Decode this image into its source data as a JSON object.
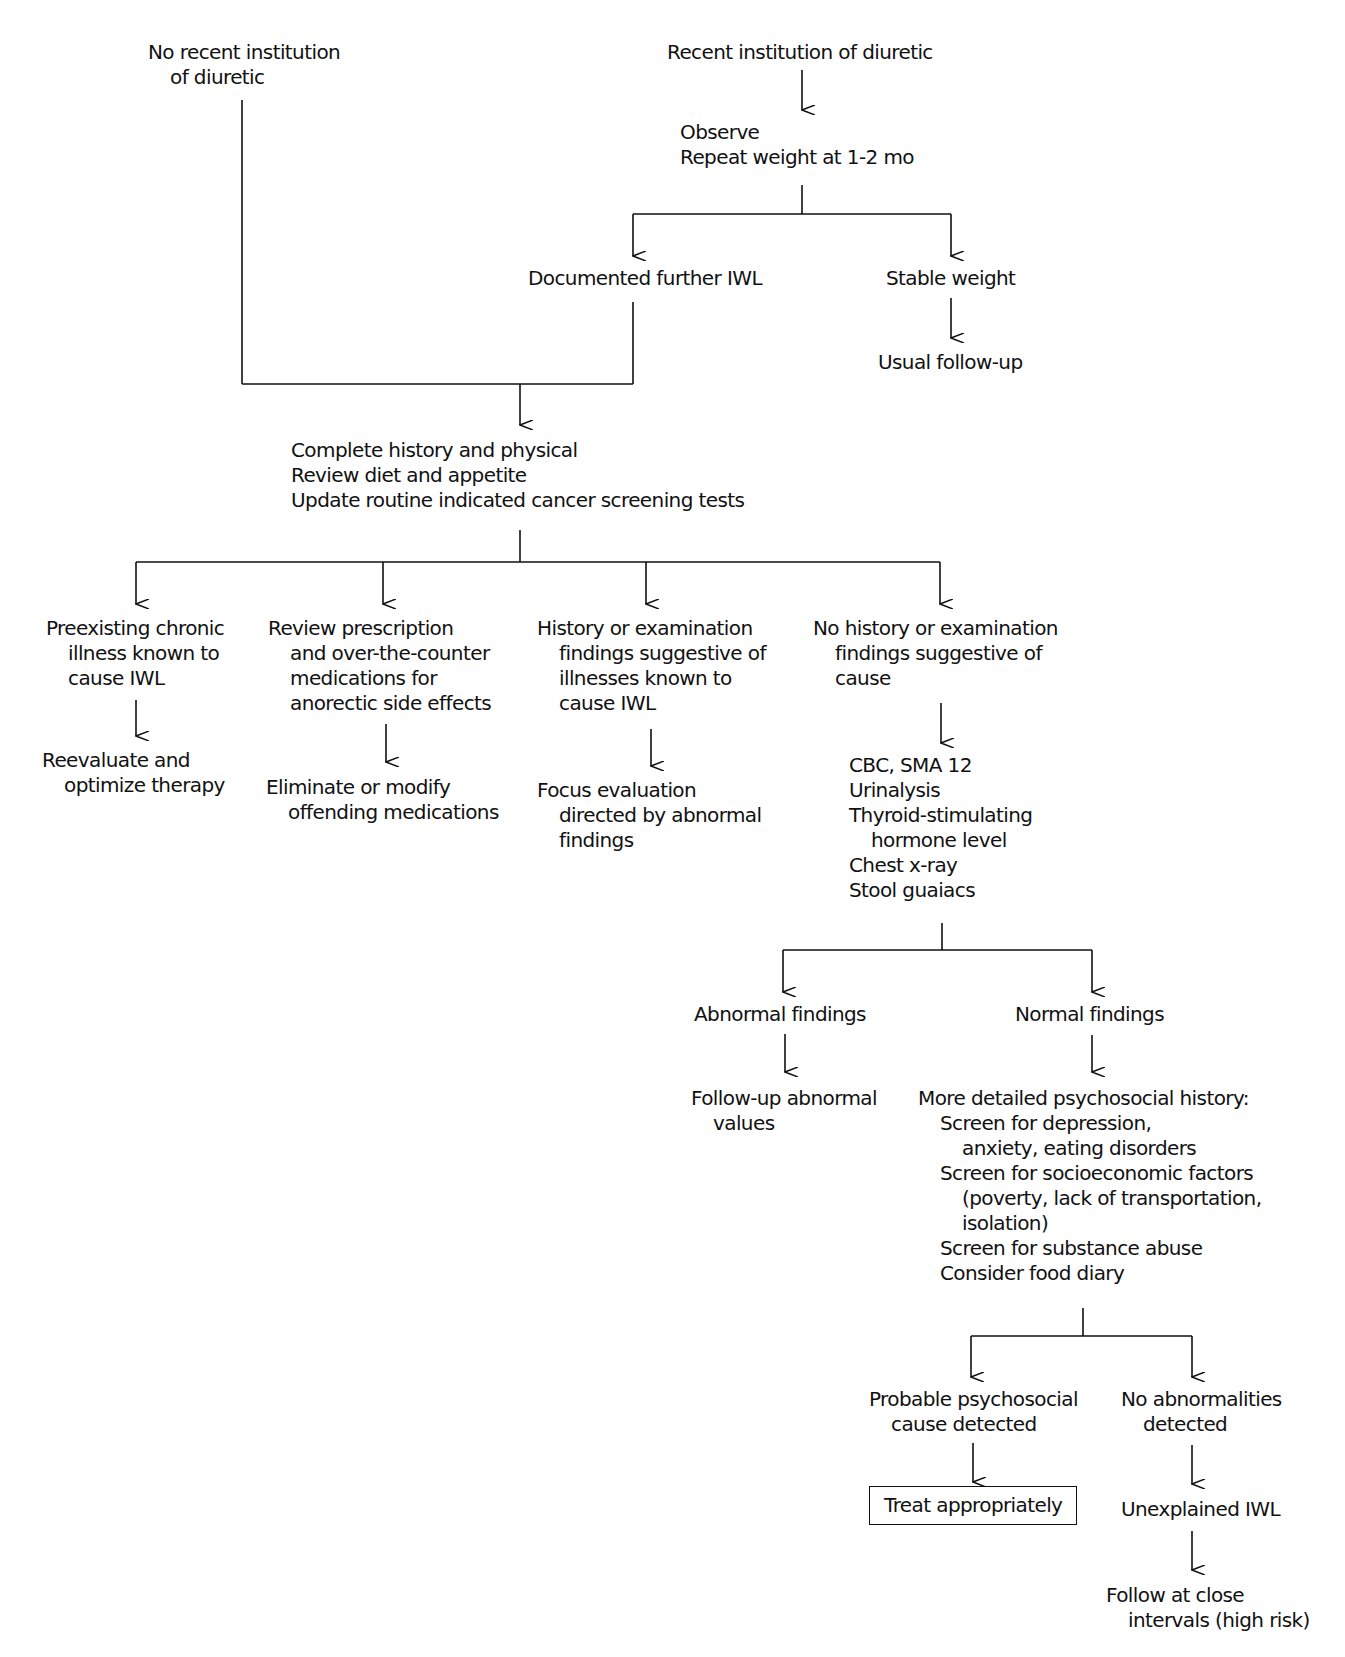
{
  "diagram": {
    "type": "flowchart",
    "line_color": "#111111",
    "nodes": {
      "no_recent_diuretic": {
        "lines": [
          "No recent institution",
          "of diuretic"
        ]
      },
      "recent_diuretic": {
        "lines": [
          "Recent institution of diuretic"
        ]
      },
      "observe": {
        "lines": [
          "Observe",
          "Repeat weight at 1-2 mo"
        ]
      },
      "documented_iwl": {
        "lines": [
          "Documented further IWL"
        ]
      },
      "stable_weight": {
        "lines": [
          "Stable weight"
        ]
      },
      "usual_followup": {
        "lines": [
          "Usual follow-up"
        ]
      },
      "complete_history": {
        "lines": [
          "Complete history and physical",
          "Review diet and appetite",
          "Update routine indicated cancer screening tests"
        ]
      },
      "preexisting_illness": {
        "lines": [
          "Preexisting chronic",
          "illness known to",
          "cause IWL"
        ]
      },
      "reevaluate": {
        "lines": [
          "Reevaluate and",
          "optimize therapy"
        ]
      },
      "review_prescription": {
        "lines": [
          "Review prescription",
          "and over-the-counter",
          "medications for",
          "anorectic side effects"
        ]
      },
      "eliminate_meds": {
        "lines": [
          "Eliminate or modify",
          "offending medications"
        ]
      },
      "history_suggestive": {
        "lines": [
          "History or examination",
          "findings suggestive of",
          "illnesses known to",
          "cause IWL"
        ]
      },
      "focus_evaluation": {
        "lines": [
          "Focus evaluation",
          "directed by abnormal",
          "findings"
        ]
      },
      "no_history": {
        "lines": [
          "No history or examination",
          "findings suggestive of",
          "cause"
        ]
      },
      "lab_tests": {
        "lines": [
          "CBC, SMA 12",
          "Urinalysis",
          "Thyroid-stimulating",
          "hormone level",
          "Chest x-ray",
          "Stool guaiacs"
        ]
      },
      "abnormal_findings": {
        "lines": [
          "Abnormal findings"
        ]
      },
      "followup_abnormal": {
        "lines": [
          "Follow-up abnormal",
          "values"
        ]
      },
      "normal_findings": {
        "lines": [
          "Normal findings"
        ]
      },
      "psychosocial": {
        "lines": [
          "More detailed psychosocial history:",
          "Screen for depression,",
          "anxiety, eating disorders",
          "Screen for socioeconomic factors",
          "(poverty, lack of transportation,",
          "isolation)",
          "Screen for substance abuse",
          "Consider food diary"
        ]
      },
      "probable_psychosocial": {
        "lines": [
          "Probable psychosocial",
          "cause detected"
        ]
      },
      "treat": {
        "lines": [
          "Treat appropriately"
        ]
      },
      "no_abnormalities": {
        "lines": [
          "No abnormalities",
          "detected"
        ]
      },
      "unexplained_iwl": {
        "lines": [
          "Unexplained IWL"
        ]
      },
      "follow_close": {
        "lines": [
          "Follow at close",
          "intervals (high risk)"
        ]
      }
    }
  }
}
